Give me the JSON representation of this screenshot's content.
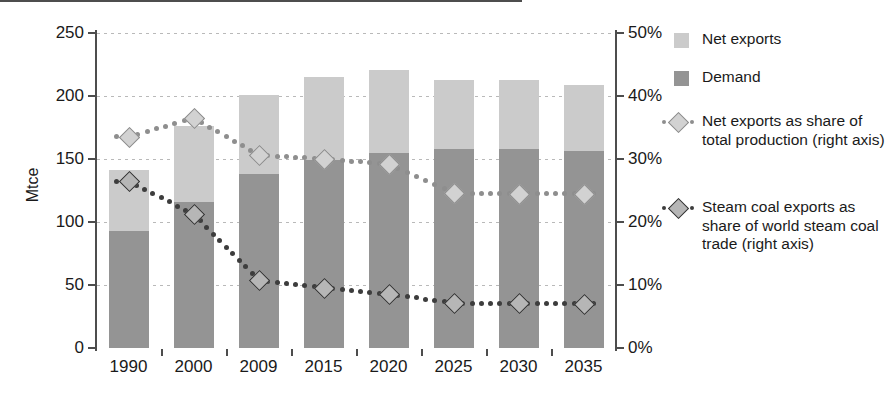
{
  "chart_data": {
    "type": "bar",
    "title": "",
    "subtitle": "",
    "xlabel": "",
    "ylabel": "Mtce",
    "y2label": "",
    "categories": [
      "1990",
      "2000",
      "2009",
      "2015",
      "2020",
      "2025",
      "2030",
      "2035"
    ],
    "ylim": [
      0,
      250
    ],
    "yticks": [
      0,
      50,
      100,
      150,
      200,
      250
    ],
    "ytick_labels": [
      "0",
      "50",
      "100",
      "150",
      "200",
      "250"
    ],
    "y2lim": [
      0,
      50
    ],
    "y2ticks": [
      0,
      10,
      20,
      30,
      40,
      50
    ],
    "y2tick_labels": [
      "0%",
      "10%",
      "20%",
      "30%",
      "40%",
      "50%"
    ],
    "grid": true,
    "legend_position": "right",
    "stacked": true,
    "series": [
      {
        "name": "Demand",
        "kind": "bar-stack",
        "color": "#949494",
        "axis": "left",
        "values": [
          93,
          116,
          138,
          149,
          155,
          158,
          158,
          156
        ]
      },
      {
        "name": "Net exports",
        "kind": "bar-stack",
        "color": "#cbcbcb",
        "axis": "left",
        "values": [
          48,
          60,
          63,
          66,
          66,
          55,
          55,
          53
        ]
      },
      {
        "name": "Net exports as share of total production (right axis)",
        "kind": "line-dotted",
        "color": "#8e8e8e",
        "marker": "diamond-light",
        "axis": "right",
        "values": [
          33.5,
          36.5,
          30.6,
          30.0,
          29.2,
          24.6,
          24.5,
          24.5
        ]
      },
      {
        "name": "Steam coal exports as share of world steam coal trade (right axis)",
        "kind": "line-dotted",
        "color": "#3d3d3d",
        "marker": "diamond-dark",
        "axis": "right",
        "values": [
          26.5,
          21.2,
          10.8,
          9.5,
          8.6,
          7.1,
          7.1,
          7.0
        ]
      }
    ],
    "bar_totals": [
      141,
      176,
      201,
      215,
      221,
      213,
      213,
      209
    ]
  },
  "axes": {
    "left_title": "Mtce",
    "left_ticks": [
      "250",
      "200",
      "150",
      "100",
      "50",
      "0"
    ],
    "right_ticks": [
      "50%",
      "40%",
      "30%",
      "20%",
      "10%",
      "0%"
    ],
    "x_ticks": [
      "1990",
      "2000",
      "2009",
      "2015",
      "2020",
      "2025",
      "2030",
      "2035"
    ]
  },
  "legend": {
    "items": [
      {
        "label": "Net exports",
        "type": "swatch-light"
      },
      {
        "label": "Demand",
        "type": "swatch-dark"
      },
      {
        "label": "Net exports as share of total production (right axis)",
        "type": "marker-light"
      },
      {
        "label": "Steam coal exports as share of world steam coal trade (right axis)",
        "type": "marker-dark"
      }
    ]
  },
  "colors": {
    "net_exports": "#cbcbcb",
    "demand": "#949494",
    "line_light": "#8e8e8e",
    "line_dark": "#3d3d3d",
    "axis": "#4d4d4d",
    "grid": "#b9b9b9"
  }
}
